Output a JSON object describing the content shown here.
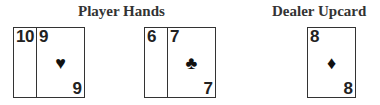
{
  "headings": {
    "player": "Player Hands",
    "dealer": "Dealer Upcard"
  },
  "player_hands": [
    {
      "cards": [
        {
          "rank": "10",
          "suit": "hearts",
          "pip": "♥"
        },
        {
          "rank": "9",
          "suit": "hearts",
          "pip": "♥"
        }
      ]
    },
    {
      "cards": [
        {
          "rank": "6",
          "suit": "clubs",
          "pip": "♣"
        },
        {
          "rank": "7",
          "suit": "clubs",
          "pip": "♣"
        }
      ]
    }
  ],
  "dealer_upcard": {
    "rank": "8",
    "suit": "diamonds",
    "pip": "♦"
  }
}
